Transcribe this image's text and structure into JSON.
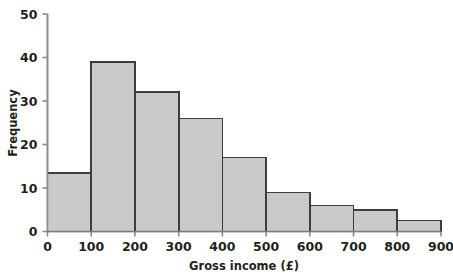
{
  "chart_data": {
    "type": "bar",
    "title": "",
    "xlabel": "Gross income (£)",
    "ylabel": "Frequency",
    "bin_width": 100,
    "bin_edges": [
      0,
      100,
      200,
      300,
      400,
      500,
      600,
      700,
      800,
      900
    ],
    "categories": [
      "0-100",
      "100-200",
      "200-300",
      "300-400",
      "400-500",
      "500-600",
      "600-700",
      "700-800",
      "800-900"
    ],
    "values": [
      13.5,
      39,
      32,
      26,
      17,
      9,
      6,
      5,
      2.5
    ],
    "xlim": [
      0,
      900
    ],
    "ylim": [
      0,
      50
    ],
    "xticks": [
      0,
      100,
      200,
      300,
      400,
      500,
      600,
      700,
      800,
      900
    ],
    "yticks": [
      0,
      10,
      20,
      30,
      40,
      50
    ],
    "xtick_labels": [
      "0",
      "100",
      "200",
      "300",
      "400",
      "500",
      "600",
      "700",
      "800",
      "900"
    ],
    "ytick_labels": [
      "0",
      "10",
      "20",
      "30",
      "40",
      "50"
    ],
    "grid": false,
    "legend": null,
    "bar_fill": "#c9c9c9",
    "bar_edge": "#3d3d3d",
    "axis_color": "#8a8a8a",
    "text_color": "#231f20"
  },
  "axes": {
    "x_title": "Gross income (£)",
    "y_title": "Frequency"
  }
}
